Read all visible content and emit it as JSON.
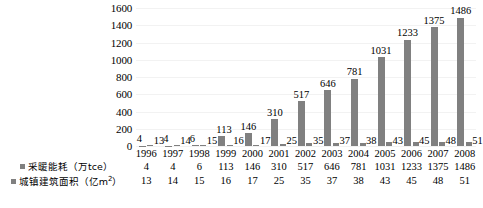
{
  "chart_data": {
    "type": "bar",
    "title": "",
    "xlabel": "",
    "ylabel": "",
    "ylim": [
      0,
      1600
    ],
    "ytick_step": 200,
    "yticks": [
      "1600",
      "1400",
      "1200",
      "1000",
      "800",
      "600",
      "400",
      "200",
      "0"
    ],
    "grid": true,
    "legend_position": "bottom-left",
    "categories": [
      "1996",
      "1997",
      "1998",
      "1999",
      "2000",
      "2001",
      "2002",
      "2003",
      "2004",
      "2005",
      "2006",
      "2007",
      "2008"
    ],
    "series": [
      {
        "name": "采暖能耗（万tce）",
        "color": "#808080",
        "values": [
          4,
          4,
          6,
          113,
          146,
          310,
          517,
          646,
          781,
          1031,
          1233,
          1375,
          1486
        ]
      },
      {
        "name": "城镇建筑面积（亿m²）",
        "color": "#808080",
        "values": [
          13,
          14,
          15,
          16,
          17,
          25,
          35,
          37,
          38,
          43,
          45,
          48,
          51
        ]
      }
    ]
  },
  "legend": {
    "series1_label_main": "采暖能耗（万tce）",
    "series2_label_main": "城镇建筑面积（亿m",
    "series2_label_sup": "2",
    "series2_label_tail": "）"
  },
  "axis": {
    "y_ticks": [
      "1600",
      "1400",
      "1200",
      "1000",
      "800",
      "600",
      "400",
      "200",
      "0"
    ]
  },
  "bar_labels": {
    "series1": [
      "4",
      "4",
      "6",
      "113",
      "146",
      "310",
      "517",
      "646",
      "781",
      "1031",
      "1233",
      "1375",
      "1486"
    ],
    "series2": [
      "13",
      "14",
      "15",
      "16",
      "17",
      "25",
      "35",
      "37",
      "38",
      "43",
      "45",
      "48",
      "51"
    ]
  },
  "table": {
    "years": [
      "1996",
      "1997",
      "1998",
      "1999",
      "2000",
      "2001",
      "2002",
      "2003",
      "2004",
      "2005",
      "2006",
      "2007",
      "2008"
    ],
    "row1_values": [
      "4",
      "4",
      "6",
      "113",
      "146",
      "310",
      "517",
      "646",
      "781",
      "1031",
      "1233",
      "1375",
      "1486"
    ],
    "row2_values": [
      "13",
      "14",
      "15",
      "16",
      "17",
      "25",
      "35",
      "37",
      "38",
      "43",
      "45",
      "48",
      "51"
    ]
  },
  "colors": {
    "bar": "#808080",
    "grid": "#f2f2f2",
    "text": "#000000"
  }
}
